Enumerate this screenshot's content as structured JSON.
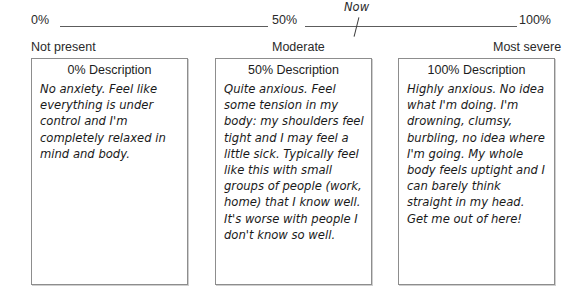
{
  "scale": {
    "ticks": [
      {
        "value": "0%"
      },
      {
        "value": "50%"
      },
      {
        "value": "100%"
      }
    ],
    "now_marker": {
      "label": "Now",
      "position_percent": 62
    },
    "anchors": [
      {
        "label": "Not present"
      },
      {
        "label": "Moderate"
      },
      {
        "label": "Most severe"
      }
    ]
  },
  "boxes": [
    {
      "header": "0% Description",
      "body": "No anxiety. Feel like everything is under control and I'm completely relaxed in mind and body."
    },
    {
      "header": "50% Description",
      "body": "Quite anxious. Feel some tension in my body: my shoulders feel tight and I may feel a little sick. Typically feel like this with small groups of people (work, home) that I know well. It's worse with people I don't know so well."
    },
    {
      "header": "100% Description",
      "body": "Highly anxious. No idea what I'm doing. I'm drowning, clumsy, burbling, no idea where I'm going. My whole body feels uptight and I can barely think straight in my head. Get me out of here!"
    }
  ]
}
